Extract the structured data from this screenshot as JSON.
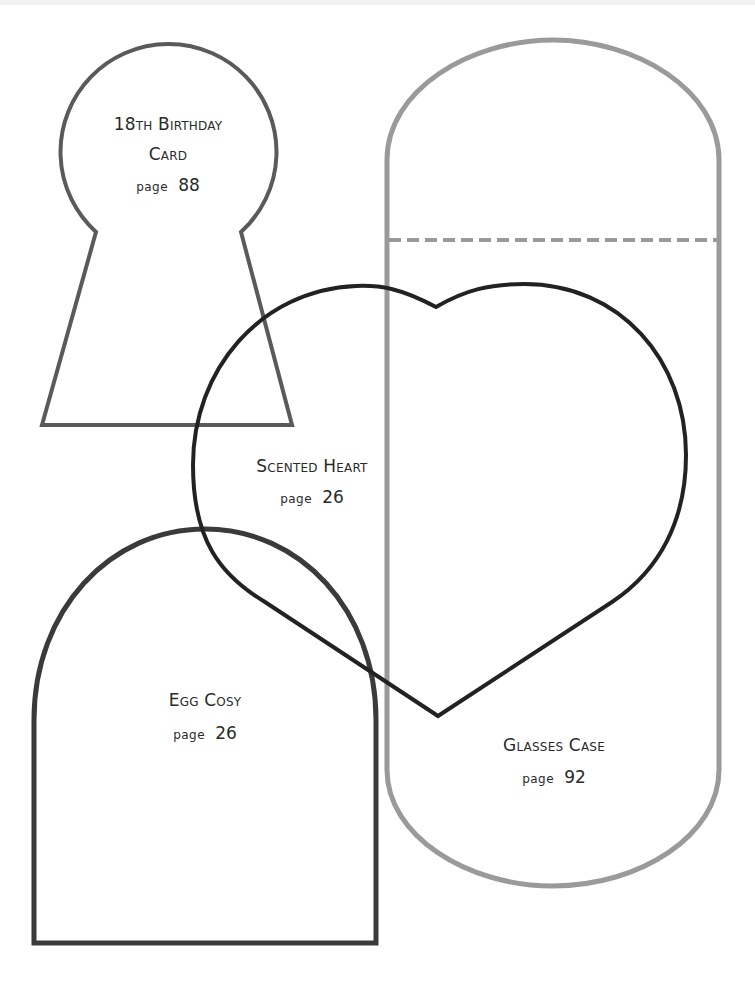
{
  "page": {
    "background": "#ffffff"
  },
  "templates": [
    {
      "id": "birthday-card",
      "title_lines": [
        "18th Birthday",
        "Card"
      ],
      "page_prefix": "page",
      "page_number": "88",
      "stroke": "#5a5a5a"
    },
    {
      "id": "glasses-case",
      "title_lines": [
        "Glasses Case"
      ],
      "page_prefix": "page",
      "page_number": "92",
      "stroke": "#9a9a9a",
      "fold_line": "dashed"
    },
    {
      "id": "scented-heart",
      "title_lines": [
        "Scented Heart"
      ],
      "page_prefix": "page",
      "page_number": "26",
      "stroke": "#222222"
    },
    {
      "id": "egg-cosy",
      "title_lines": [
        "Egg Cosy"
      ],
      "page_prefix": "page",
      "page_number": "26",
      "stroke": "#3a3a3a"
    }
  ]
}
